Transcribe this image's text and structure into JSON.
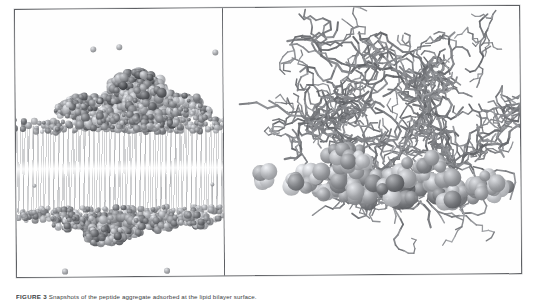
{
  "figure": {
    "caption_label": "FIGURE 3",
    "caption_text": "Snapshots of the peptide aggregate adsorbed at the lipid bilayer surface.",
    "panels": [
      {
        "id": "left",
        "name": "membrane-overview-panel",
        "title": "Peptide aggregate adsorbed on lipid bilayer",
        "representation": "van der Waals spheres",
        "contents": [
          "lipid bilayer",
          "upper leaflet head groups",
          "lower leaflet head groups",
          "lipid acyl tails",
          "peptide aggregate",
          "free counter-ions"
        ]
      },
      {
        "id": "right",
        "name": "peptide-closeup-panel",
        "title": "Close-up of the peptide aggregate",
        "representation": "licorice sticks with van der Waals spheres",
        "contents": [
          "peptide backbone sticks",
          "side-chain spheres",
          "extended peptide chain",
          "isolated ion"
        ]
      }
    ]
  },
  "colors": {
    "frame": "#5d5f63",
    "background": "#ffffff",
    "panel_background": "#fefefe",
    "lipid_tail": "#96989c",
    "headgroup_dark": "#6e7075",
    "headgroup_mid": "#8c8e93",
    "peptide_dark": "#5a5c60",
    "peptide_mid": "#87898e",
    "peptide_light": "#b5b7bb",
    "stick": "#76787d",
    "caption_text": "#3a3c40"
  }
}
